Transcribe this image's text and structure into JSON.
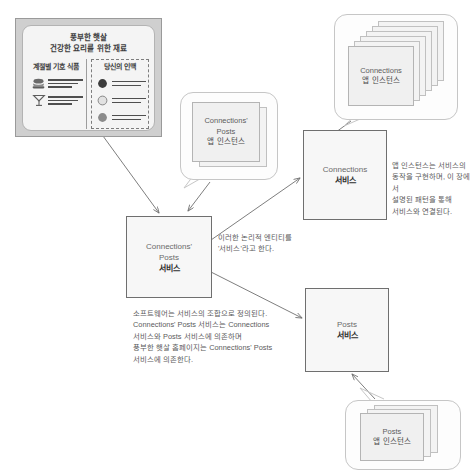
{
  "diagram": {
    "title": "서비스와 앱 인스턴스 관계도",
    "mockup": {
      "name": "풍부한 햇살 홈페이지 목업",
      "title_line1": "풍부한 햇살",
      "title_line2": "건강한 요리를 위한 재료",
      "left_column": {
        "heading": "계절별 기호 식품",
        "rows": [
          {
            "icon": "burger-icon"
          },
          {
            "icon": "cocktail-glass-icon"
          }
        ]
      },
      "right_column": {
        "heading": "당신의 인맥",
        "rows": [
          {
            "icon": "avatar-dark-icon"
          },
          {
            "icon": "avatar-light-icon"
          },
          {
            "icon": "avatar-medium-icon"
          }
        ]
      }
    },
    "services": [
      {
        "id": "connections-posts-service",
        "en_line1": "Connections'",
        "en_line2": "Posts",
        "ko": "서비스"
      },
      {
        "id": "connections-service",
        "en_line1": "Connections",
        "en_line2": "",
        "ko": "서비스"
      },
      {
        "id": "posts-service",
        "en_line1": "Posts",
        "en_line2": "",
        "ko": "서비스"
      }
    ],
    "instance_groups": [
      {
        "id": "connections-posts-app-instances",
        "en_line1": "Connections'",
        "en_line2": "Posts",
        "ko": "앱 인스턴스",
        "card_count": 2
      },
      {
        "id": "connections-app-instances",
        "en_line1": "Connections",
        "en_line2": "",
        "ko": "앱 인스턴스",
        "card_count": 6
      },
      {
        "id": "posts-app-instances",
        "en_line1": "Posts",
        "en_line2": "",
        "ko": "앱 인스턴스",
        "card_count": 3
      }
    ],
    "notes": {
      "middle": "이러한 논리적 엔티티를\n'서비스'라고 한다.",
      "right": "앱 인스턴스는 서비스의\n동작을 구현하며, 이 장에서\n설명된 패턴을 통해\n서비스와 연결된다.",
      "bottom": "소프트웨어는 서비스의 조합으로 정의된다.\nConnections' Posts 서비스는 Connections\n서비스와 Posts 서비스에 의존하며\n풍부한 햇살 홈페이지는 Connections' Posts\n서비스에 의존한다."
    },
    "colors": {
      "box_fill": "#f7f7f7",
      "box_stroke": "#6f6f6f",
      "bubble_stroke": "#c6c6c6",
      "card_fill": "#f0f0f0",
      "text": "#4a4a4a",
      "mock_frame": "#cfcfcf"
    }
  }
}
